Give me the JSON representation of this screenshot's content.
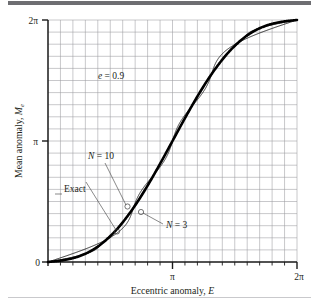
{
  "figure": {
    "name": "kepler-equation-fourier-series-plot",
    "background": "#ffffff",
    "rule_color": "#6e6e72"
  },
  "chart_data": {
    "type": "line",
    "title": "",
    "xlabel": "Eccentric anomaly, E",
    "ylabel": "Mean anomaly, M",
    "ylabel_sub": "e",
    "xlim": [
      0,
      6.283185307179586
    ],
    "ylim": [
      0,
      6.283185307179586
    ],
    "xticks": [
      0,
      3.141592653589793,
      6.283185307179586
    ],
    "xticklabels": [
      "0",
      "π",
      "2π"
    ],
    "yticks": [
      0,
      3.141592653589793,
      6.283185307179586
    ],
    "yticklabels": [
      "0",
      "π",
      "2π"
    ],
    "grid": true,
    "grid_divisions_x": 20,
    "grid_divisions_y": 20,
    "minor_ticks_x": 20,
    "legend": "none",
    "eccentricity": 0.9,
    "series": [
      {
        "name": "Exact",
        "style": "thick-solid",
        "description": "M = E - e sin E with e = 0.9",
        "x": [
          0.0,
          0.314,
          0.628,
          0.942,
          1.257,
          1.571,
          1.885,
          2.199,
          2.513,
          2.827,
          3.142,
          3.456,
          3.77,
          4.084,
          4.398,
          4.712,
          5.027,
          5.341,
          5.655,
          5.969,
          6.283
        ],
        "y": [
          0.0,
          0.036,
          0.1,
          0.213,
          0.401,
          0.671,
          1.029,
          1.471,
          1.985,
          2.549,
          3.142,
          3.734,
          4.298,
          4.812,
          5.254,
          5.612,
          5.882,
          6.07,
          6.183,
          6.247,
          6.283
        ]
      },
      {
        "name": "N = 3",
        "style": "thin-oscillating",
        "description": "3-term Bessel/Fourier sine series approximation of Kepler's equation",
        "terms": 3
      },
      {
        "name": "N = 10",
        "style": "thin-oscillating",
        "description": "10-term Bessel/Fourier sine series approximation of Kepler's equation",
        "terms": 10
      }
    ],
    "annotations": [
      {
        "id": "eccentricity-label",
        "text": "e = 0.9",
        "x": 1.55,
        "y": 4.6
      },
      {
        "id": "n10-label",
        "text": "N = 10",
        "x": 1.0,
        "y": 2.45,
        "points_to_x": 1.72,
        "points_to_y": 1.2
      },
      {
        "id": "exact-label",
        "text": "Exact",
        "x": 0.62,
        "y": 1.98,
        "points_to_x": 1.5,
        "points_to_y": 0.82
      },
      {
        "id": "n3-label",
        "text": "N = 3",
        "x": 3.05,
        "y": 0.9,
        "points_to_x": 2.03,
        "points_to_y": 1.03
      }
    ]
  },
  "labels": {
    "x_axis_title_main": "Eccentric anomaly, ",
    "x_axis_title_var": "E",
    "y_axis_title_main": "Mean anomaly, ",
    "y_axis_title_var": "M",
    "y_axis_title_sub": "e",
    "x_tick_0": "0",
    "x_tick_pi": "π",
    "x_tick_2pi": "2π",
    "y_tick_0": "0",
    "y_tick_pi": "π",
    "y_tick_2pi": "2π",
    "annot_e_var": "e",
    "annot_e_rest": " = 0.9",
    "annot_n10_var": "N",
    "annot_n10_rest": " = 10",
    "annot_exact": "Exact",
    "annot_n3_var": "N",
    "annot_n3_rest": " = 3"
  }
}
